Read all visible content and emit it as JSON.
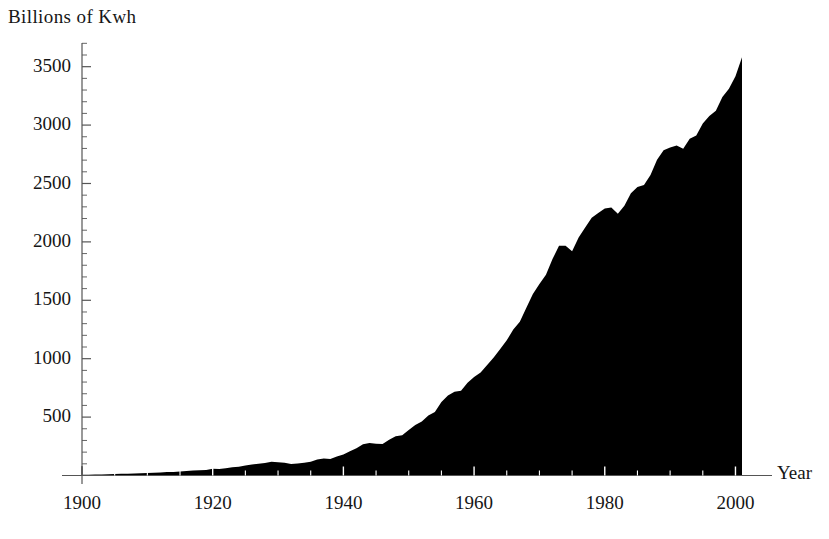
{
  "chart_data": {
    "type": "area",
    "title": "",
    "ylabel": "Billions of Kwh",
    "xlabel": "Year",
    "grid": false,
    "legend": null,
    "xlim": [
      1900,
      2001
    ],
    "ylim": [
      0,
      3750
    ],
    "x_major_ticks": [
      1900,
      1920,
      1940,
      1960,
      1980,
      2000
    ],
    "x_major_tick_labels": [
      "1900",
      "1920",
      "1940",
      "1960",
      "1980",
      "2000"
    ],
    "x_minor_tick_interval": 5,
    "y_major_ticks": [
      500,
      1000,
      1500,
      2000,
      2500,
      3000,
      3500
    ],
    "y_major_tick_labels": [
      "500",
      "1000",
      "1500",
      "2000",
      "2500",
      "3000",
      "3500"
    ],
    "y_minor_tick_interval": 100,
    "fill_color": "#000000",
    "axis_color": "#555555",
    "x": [
      1900,
      1901,
      1902,
      1903,
      1904,
      1905,
      1906,
      1907,
      1908,
      1909,
      1910,
      1911,
      1912,
      1913,
      1914,
      1915,
      1916,
      1917,
      1918,
      1919,
      1920,
      1921,
      1922,
      1923,
      1924,
      1925,
      1926,
      1927,
      1928,
      1929,
      1930,
      1931,
      1932,
      1933,
      1934,
      1935,
      1936,
      1937,
      1938,
      1939,
      1940,
      1941,
      1942,
      1943,
      1944,
      1945,
      1946,
      1947,
      1948,
      1949,
      1950,
      1951,
      1952,
      1953,
      1954,
      1955,
      1956,
      1957,
      1958,
      1959,
      1960,
      1961,
      1962,
      1963,
      1964,
      1965,
      1966,
      1967,
      1968,
      1969,
      1970,
      1971,
      1972,
      1973,
      1974,
      1975,
      1976,
      1977,
      1978,
      1979,
      1980,
      1981,
      1982,
      1983,
      1984,
      1985,
      1986,
      1987,
      1988,
      1989,
      1990,
      1991,
      1992,
      1993,
      1994,
      1995,
      1996,
      1997,
      1998,
      1999,
      2000,
      2001
    ],
    "values": [
      6,
      7,
      8,
      9,
      10,
      12,
      14,
      16,
      17,
      19,
      21,
      23,
      26,
      29,
      31,
      34,
      39,
      43,
      46,
      48,
      57,
      55,
      61,
      71,
      75,
      85,
      94,
      101,
      108,
      117,
      114,
      109,
      99,
      102,
      110,
      118,
      136,
      146,
      142,
      162,
      180,
      208,
      233,
      267,
      279,
      271,
      270,
      307,
      336,
      345,
      389,
      433,
      463,
      514,
      544,
      629,
      684,
      716,
      725,
      794,
      844,
      881,
      946,
      1011,
      1084,
      1158,
      1250,
      1317,
      1436,
      1553,
      1640,
      1718,
      1853,
      1966,
      1968,
      1920,
      2038,
      2124,
      2206,
      2247,
      2286,
      2295,
      2241,
      2310,
      2416,
      2470,
      2487,
      2572,
      2704,
      2784,
      2808,
      2825,
      2797,
      2883,
      2911,
      3013,
      3078,
      3123,
      3240,
      3312,
      3418,
      3580
    ]
  }
}
